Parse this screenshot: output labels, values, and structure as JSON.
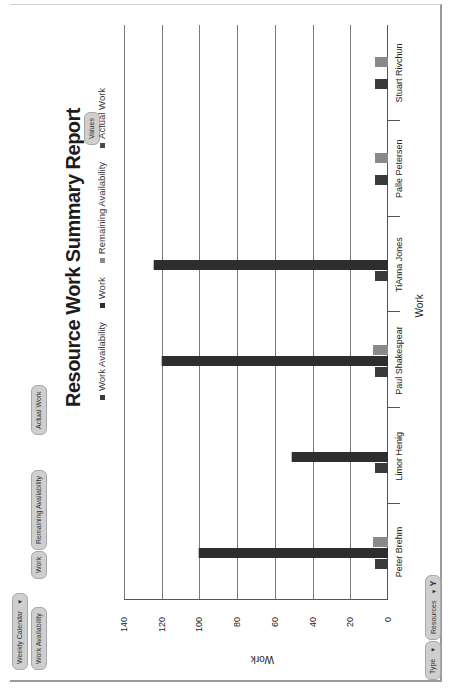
{
  "report": {
    "title": "Resource Work Summary Report",
    "values_button": "Values"
  },
  "toolbar": {
    "view_dropdown": "Weekly Calendar",
    "fields": [
      "Work Availability",
      "Work",
      "Remaining Availability",
      "Actual Work"
    ],
    "filter_type": "Type",
    "filter_resources": "Resources"
  },
  "legend": [
    {
      "label": "Work Availability",
      "color": "#3a3a3a"
    },
    {
      "label": "Work",
      "color": "#2e2e2e"
    },
    {
      "label": "Remaining Availability",
      "color": "#8a8a8a"
    },
    {
      "label": "Actual Work",
      "color": "#4a4a4a"
    }
  ],
  "chart_data": {
    "type": "bar",
    "orientation": "vertical (image rotated 90°)",
    "title": "Resource Work Summary Report",
    "xlabel": "Work",
    "ylabel": "Work",
    "ylim": [
      0,
      140
    ],
    "yticks": [
      0,
      20,
      40,
      60,
      80,
      100,
      120,
      140
    ],
    "grid": true,
    "legend_position": "top",
    "categories": [
      "Peter Brehm",
      "Limor Henig",
      "Paul Shakespear",
      "TiAnna Jones",
      "Palle Petersen",
      "Stuart Rivchun"
    ],
    "series": [
      {
        "name": "Work Availability",
        "values": [
          7,
          7,
          7,
          7,
          7,
          7
        ]
      },
      {
        "name": "Work",
        "values": [
          100,
          51,
          120,
          124,
          0,
          0
        ]
      },
      {
        "name": "Remaining Availability",
        "values": [
          8,
          0,
          8,
          0,
          7,
          7
        ]
      },
      {
        "name": "Actual Work",
        "values": [
          0,
          0,
          0,
          0,
          0,
          0
        ]
      }
    ]
  }
}
